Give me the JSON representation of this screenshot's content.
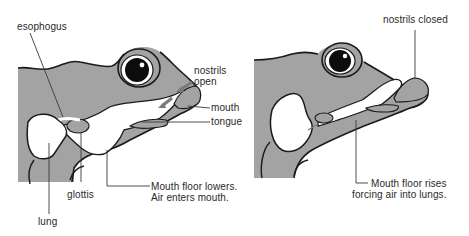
{
  "colors": {
    "skin": "#a3a3a3",
    "outline": "#1a1a1a",
    "cavity": "#ffffff",
    "leader": "#3a3a3a",
    "text": "#2a2a2a",
    "airflow_arrow": "#7a7a7a"
  },
  "left_panel": {
    "stage": "inhalation into mouth",
    "labels": {
      "esophagus": "esophogus",
      "nostrils": "nostrils",
      "nostrils_state": "open",
      "mouth": "mouth",
      "tongue": "tongue",
      "glottis": "glottis",
      "lung": "lung",
      "caption_line1": "Mouth floor lowers.",
      "caption_line2": "Air enters mouth."
    }
  },
  "right_panel": {
    "stage": "air forced into lungs",
    "labels": {
      "nostrils": "nostrils closed",
      "caption_line1": "Mouth floor rises",
      "caption_line2": "forcing air into lungs."
    }
  }
}
